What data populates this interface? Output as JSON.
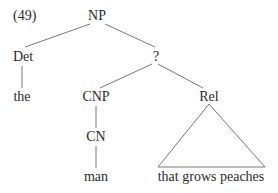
{
  "example_number": "(49)",
  "tree": {
    "root": "NP",
    "det": "Det",
    "det_word": "the",
    "unknown": "?",
    "cnp": "CNP",
    "cn": "CN",
    "cn_word": "man",
    "rel": "Rel",
    "rel_phrase": "that grows peaches"
  }
}
